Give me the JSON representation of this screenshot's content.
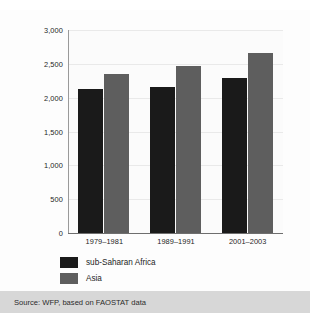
{
  "chart_data": {
    "type": "bar",
    "title": "",
    "xlabel": "",
    "ylabel": "Kcal available per person and per day",
    "categories": [
      "1979–1981",
      "1989–1991",
      "2001–2003"
    ],
    "series": [
      {
        "name": "sub-Saharan Africa",
        "color": "#1a1a1a",
        "values": [
          2130,
          2160,
          2290
        ]
      },
      {
        "name": "Asia",
        "color": "#5e5e5e",
        "values": [
          2350,
          2470,
          2660
        ]
      }
    ],
    "ylim": [
      0,
      3000
    ],
    "yticks": [
      "0",
      "500",
      "1,000",
      "1,500",
      "2,000",
      "2,500",
      "3,000"
    ],
    "ytick_values": [
      0,
      500,
      1000,
      1500,
      2000,
      2500,
      3000
    ],
    "grid": true,
    "legend_position": "bottom-left"
  },
  "source": {
    "text": "Source: WFP, based on FAOSTAT data"
  }
}
